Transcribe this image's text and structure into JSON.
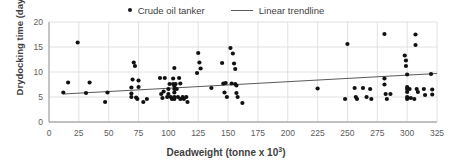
{
  "legend": {
    "position": "top",
    "entries": [
      {
        "label": "Crude oil tanker",
        "marker": "dot-marker-icon",
        "color": "#1a1a1a"
      },
      {
        "label": "Linear trendline",
        "marker": "line-marker-icon",
        "color": "#5a5a5a"
      }
    ]
  },
  "axes": {
    "x_title": "Deadweight (tonne x 10",
    "x_title_sup": "3",
    "x_title_tail": ")",
    "y_title": "Drydocking time (day)"
  },
  "chart_data": {
    "type": "scatter",
    "title": "",
    "xlabel": "Deadweight (tonne x 10^3)",
    "ylabel": "Drydocking time (day)",
    "xlim": [
      0,
      325
    ],
    "ylim": [
      0,
      20
    ],
    "xticks": [
      0,
      25,
      50,
      75,
      100,
      125,
      150,
      175,
      200,
      225,
      250,
      275,
      300,
      325
    ],
    "yticks": [
      0,
      5,
      10,
      15,
      20
    ],
    "grid": true,
    "grid_color": "#d9d9d9",
    "marker_color": "#111111",
    "legend": [
      "Crude oil tanker",
      "Linear trendline"
    ],
    "series": [
      {
        "name": "Crude oil tanker",
        "type": "scatter",
        "points": [
          [
            12,
            5.9
          ],
          [
            16,
            7.9
          ],
          [
            24,
            15.9
          ],
          [
            31,
            5.8
          ],
          [
            34,
            7.9
          ],
          [
            47,
            4.0
          ],
          [
            49,
            5.9
          ],
          [
            69,
            5.0
          ],
          [
            69,
            5.7
          ],
          [
            69,
            6.9
          ],
          [
            70,
            8.5
          ],
          [
            71,
            11.9
          ],
          [
            72,
            11.2
          ],
          [
            73,
            4.9
          ],
          [
            74,
            4.6
          ],
          [
            75,
            8.3
          ],
          [
            75,
            7.0
          ],
          [
            79,
            4.0
          ],
          [
            82,
            4.6
          ],
          [
            93,
            8.8
          ],
          [
            94,
            5.6
          ],
          [
            95,
            4.8
          ],
          [
            96,
            6.1
          ],
          [
            97,
            8.8
          ],
          [
            99,
            5.0
          ],
          [
            100,
            5.6
          ],
          [
            100,
            6.6
          ],
          [
            101,
            7.6
          ],
          [
            102,
            5.0
          ],
          [
            103,
            4.6
          ],
          [
            104,
            8.7
          ],
          [
            104,
            7.6
          ],
          [
            105,
            10.8
          ],
          [
            105,
            7.2
          ],
          [
            105,
            6.6
          ],
          [
            105,
            5.9
          ],
          [
            105,
            5.0
          ],
          [
            105,
            4.6
          ],
          [
            106,
            7.6
          ],
          [
            107,
            6.6
          ],
          [
            108,
            5.0
          ],
          [
            109,
            8.8
          ],
          [
            110,
            7.7
          ],
          [
            110,
            4.6
          ],
          [
            112,
            5.0
          ],
          [
            113,
            4.6
          ],
          [
            115,
            5.0
          ],
          [
            116,
            4.0
          ],
          [
            124,
            9.8
          ],
          [
            125,
            13.8
          ],
          [
            126,
            11.9
          ],
          [
            127,
            10.7
          ],
          [
            136,
            6.8
          ],
          [
            145,
            11.8
          ],
          [
            146,
            7.7
          ],
          [
            147,
            5.9
          ],
          [
            148,
            7.8
          ],
          [
            149,
            5.0
          ],
          [
            152,
            14.8
          ],
          [
            153,
            7.7
          ],
          [
            154,
            13.7
          ],
          [
            155,
            11.7
          ],
          [
            156,
            10.6
          ],
          [
            156,
            7.6
          ],
          [
            157,
            7.3
          ],
          [
            157,
            5.8
          ],
          [
            158,
            5.0
          ],
          [
            162,
            3.8
          ],
          [
            225,
            6.7
          ],
          [
            248,
            4.6
          ],
          [
            250,
            15.6
          ],
          [
            256,
            6.8
          ],
          [
            257,
            5.0
          ],
          [
            258,
            4.6
          ],
          [
            263,
            6.8
          ],
          [
            266,
            5.0
          ],
          [
            269,
            6.6
          ],
          [
            270,
            4.6
          ],
          [
            281,
            17.6
          ],
          [
            281,
            8.7
          ],
          [
            281,
            7.5
          ],
          [
            282,
            5.6
          ],
          [
            283,
            4.6
          ],
          [
            286,
            5.6
          ],
          [
            298,
            13.3
          ],
          [
            299,
            12.3
          ],
          [
            299,
            11.2
          ],
          [
            300,
            9.5
          ],
          [
            300,
            7.0
          ],
          [
            300,
            6.6
          ],
          [
            300,
            6.0
          ],
          [
            300,
            5.0
          ],
          [
            300,
            4.6
          ],
          [
            302,
            6.6
          ],
          [
            303,
            4.8
          ],
          [
            306,
            4.6
          ],
          [
            307,
            17.5
          ],
          [
            307,
            15.4
          ],
          [
            308,
            6.6
          ],
          [
            309,
            6.0
          ],
          [
            314,
            6.6
          ],
          [
            315,
            5.4
          ],
          [
            320,
            9.6
          ],
          [
            321,
            6.5
          ],
          [
            321,
            5.5
          ]
        ]
      },
      {
        "name": "Linear trendline",
        "type": "line",
        "points": [
          [
            12,
            5.6
          ],
          [
            325,
            9.7
          ]
        ],
        "color": "#5a5a5a"
      }
    ]
  }
}
